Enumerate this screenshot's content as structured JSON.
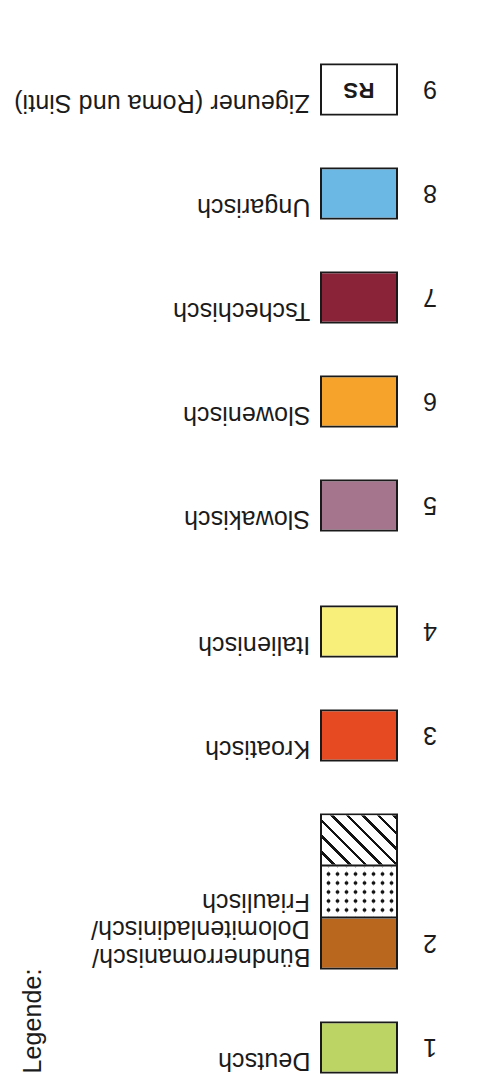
{
  "legend": {
    "title": "Legende:",
    "groups": [
      {
        "id": "group-a",
        "entries": [
          {
            "index": "1",
            "label_lines": [
              "Deutsch"
            ],
            "segments": [
              {
                "fill": "solid",
                "color": "#bcd463"
              }
            ]
          },
          {
            "index": "2",
            "label_lines": [
              "Bündnerromanisch/",
              "Dolomitenladinisch/",
              "Friaulisch"
            ],
            "segments": [
              {
                "fill": "solid",
                "color": "#b9671f"
              },
              {
                "fill": "dots",
                "color": "#ffffff"
              },
              {
                "fill": "hatch",
                "color": "#ffffff"
              }
            ]
          },
          {
            "index": "3",
            "label_lines": [
              "Kroatisch"
            ],
            "segments": [
              {
                "fill": "solid",
                "color": "#e64a22"
              }
            ]
          },
          {
            "index": "4",
            "label_lines": [
              "Italienisch"
            ],
            "segments": [
              {
                "fill": "solid",
                "color": "#f8ee7a"
              }
            ]
          }
        ]
      },
      {
        "id": "group-b",
        "entries": [
          {
            "index": "5",
            "label_lines": [
              "Slowakisch"
            ],
            "segments": [
              {
                "fill": "solid",
                "color": "#a4758c"
              }
            ]
          },
          {
            "index": "6",
            "label_lines": [
              "Slowenisch"
            ],
            "segments": [
              {
                "fill": "solid",
                "color": "#f5a32a"
              }
            ]
          },
          {
            "index": "7",
            "label_lines": [
              "Tschechisch"
            ],
            "segments": [
              {
                "fill": "solid",
                "color": "#8b2338"
              }
            ]
          },
          {
            "index": "8",
            "label_lines": [
              "Ungarisch"
            ],
            "segments": [
              {
                "fill": "solid",
                "color": "#6bb8e5"
              }
            ]
          },
          {
            "index": "9",
            "label_lines": [
              "Zigeuner (Roma und Sinti)"
            ],
            "segments": [
              {
                "fill": "solid",
                "color": "#ffffff",
                "text": "RS"
              }
            ]
          }
        ]
      }
    ]
  }
}
